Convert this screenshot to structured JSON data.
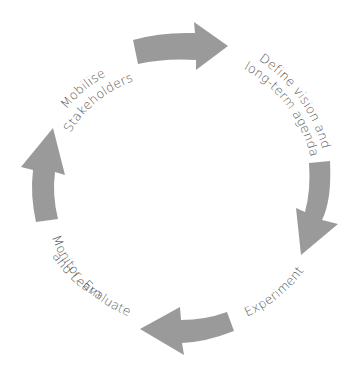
{
  "diagram": {
    "type": "cycle",
    "center": [
      176,
      190
    ],
    "colors": {
      "arrow": "#9a9a9a",
      "text": "#555555",
      "background": "#ffffff"
    },
    "steps": [
      {
        "id": "mobilise",
        "lines": [
          "Mobilise",
          "Stakeholders"
        ]
      },
      {
        "id": "define",
        "lines": [
          "Define vision and",
          "long-term agenda"
        ]
      },
      {
        "id": "experiment",
        "lines": [
          "Experiment"
        ]
      },
      {
        "id": "monitor",
        "lines": [
          "Monitor, Evaluate",
          "and Learn"
        ]
      }
    ],
    "arrows": [
      {
        "from": "mobilise",
        "to": "define",
        "direction": "clockwise"
      },
      {
        "from": "define",
        "to": "experiment",
        "direction": "clockwise"
      },
      {
        "from": "experiment",
        "to": "monitor",
        "direction": "clockwise"
      },
      {
        "from": "monitor",
        "to": "mobilise",
        "direction": "clockwise"
      }
    ]
  }
}
